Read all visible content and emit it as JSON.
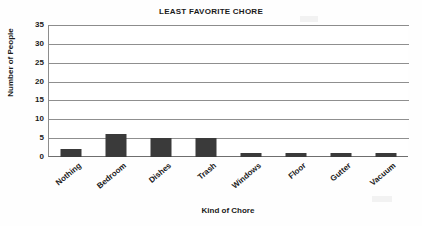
{
  "chart_data": {
    "type": "bar",
    "title": "LEAST FAVORITE CHORE",
    "xlabel": "Kind of Chore",
    "ylabel": "Number of People",
    "categories": [
      "Nothing",
      "Bedroom",
      "Dishes",
      "Trash",
      "Windows",
      "Floor",
      "Gutter",
      "Vacuum"
    ],
    "values": [
      2,
      6,
      5,
      5,
      1,
      1,
      1,
      1
    ],
    "ylim": [
      0,
      35
    ],
    "ytick_step": 5,
    "yticks": [
      "35",
      "30",
      "25",
      "20",
      "15",
      "10",
      "5",
      "0"
    ],
    "grid": "horizontal",
    "legend": "none",
    "bar_color": "#3a3a3a",
    "axis_color": "#8c8c8c",
    "background_color": "#ffffff"
  }
}
